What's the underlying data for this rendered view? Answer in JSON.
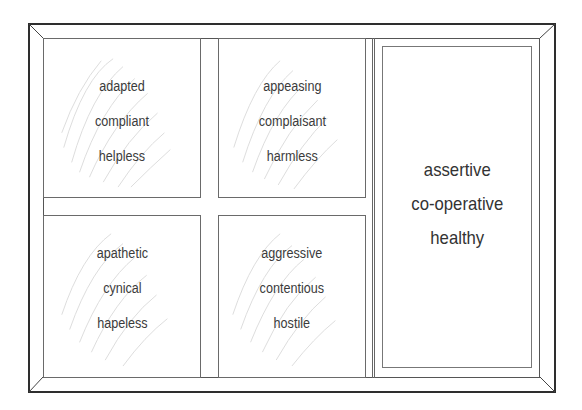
{
  "diagram": {
    "title": "",
    "quadrants": [
      {
        "id": "top-left",
        "lines": [
          "adapted",
          "compliant",
          "helpless"
        ]
      },
      {
        "id": "top-middle",
        "lines": [
          "appeasing",
          "complaisant",
          "harmless"
        ]
      },
      {
        "id": "bottom-left",
        "lines": [
          "apathetic",
          "cynical",
          "hapeless"
        ]
      },
      {
        "id": "bottom-middle",
        "lines": [
          "aggressive",
          "contentious",
          "hostile"
        ]
      }
    ],
    "highlight": {
      "id": "right",
      "lines": [
        "assertive",
        "co-operative",
        "healthy"
      ]
    },
    "colors": {
      "frame": "#2e2e2e",
      "box_border": "#6a6a6a",
      "text": "#3a3a3a",
      "scribble": "#d8d8d8"
    }
  }
}
